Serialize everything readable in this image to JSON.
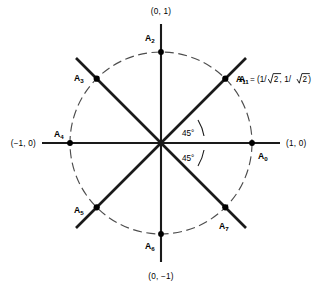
{
  "figure": {
    "type": "unit-circle-diagram",
    "center": {
      "x": 161,
      "y": 143
    },
    "radius": 91,
    "axis_labels": {
      "right": "(1, 0)",
      "left": "(−1, 0)",
      "top": "(0, 1)",
      "bottom": "(0, −1)"
    },
    "angle_labels": {
      "upper": "45°",
      "lower": "45°"
    },
    "annotation": {
      "point": "A",
      "subscript": "1",
      "equals": "= (1/",
      "radicand_a": "2",
      "middle": ", 1/",
      "radicand_b": "2",
      "close": ")",
      "full_text": "A₁ = (1/√2, 1/√2)"
    },
    "vertices": [
      {
        "id": "A0",
        "letter": "A",
        "subscript": "0",
        "angle_deg": 0,
        "coords": [
          1,
          0
        ]
      },
      {
        "id": "A1",
        "letter": "A",
        "subscript": "1",
        "angle_deg": 45,
        "coords": [
          0.7071,
          0.7071
        ]
      },
      {
        "id": "A2",
        "letter": "A",
        "subscript": "2",
        "angle_deg": 90,
        "coords": [
          0,
          1
        ]
      },
      {
        "id": "A3",
        "letter": "A",
        "subscript": "3",
        "angle_deg": 135,
        "coords": [
          -0.7071,
          0.7071
        ]
      },
      {
        "id": "A4",
        "letter": "A",
        "subscript": "4",
        "angle_deg": 180,
        "coords": [
          -1,
          0
        ]
      },
      {
        "id": "A5",
        "letter": "A",
        "subscript": "5",
        "angle_deg": 225,
        "coords": [
          -0.7071,
          -0.7071
        ]
      },
      {
        "id": "A6",
        "letter": "A",
        "subscript": "6",
        "angle_deg": 270,
        "coords": [
          0,
          -1
        ]
      },
      {
        "id": "A7",
        "letter": "A",
        "subscript": "7",
        "angle_deg": 315,
        "coords": [
          0.7071,
          -0.7071
        ]
      }
    ],
    "colors": {
      "stroke": "#1a1a1a",
      "circle": "#4d4d4d",
      "background": "#ffffff"
    }
  }
}
